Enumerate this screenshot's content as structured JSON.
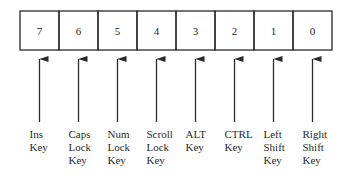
{
  "diagram": {
    "type": "bit-field",
    "bits": [
      {
        "bit": "7",
        "label": [
          "Ins",
          "Key"
        ]
      },
      {
        "bit": "6",
        "label": [
          "Caps",
          "Lock",
          "Key"
        ]
      },
      {
        "bit": "5",
        "label": [
          "Num",
          "Lock",
          "Key"
        ]
      },
      {
        "bit": "4",
        "label": [
          "Scroll",
          "Lock",
          "Key"
        ]
      },
      {
        "bit": "3",
        "label": [
          "ALT",
          "Key"
        ]
      },
      {
        "bit": "2",
        "label": [
          "CTRL",
          "Key"
        ]
      },
      {
        "bit": "1",
        "label": [
          "Left",
          "Shift",
          "Key"
        ]
      },
      {
        "bit": "0",
        "label": [
          "Right",
          "Shift",
          "Key"
        ]
      }
    ],
    "colors": {
      "stroke": "#2a2a2a",
      "text": "#2a2a2a",
      "background": "#ffffff"
    }
  }
}
